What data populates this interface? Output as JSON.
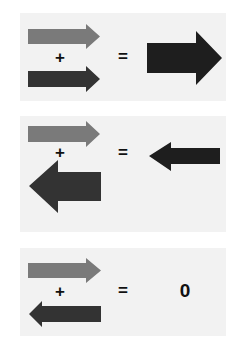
{
  "colors": {
    "background": "#ffffff",
    "panel": "#f2f2f2",
    "arrow_light": "#7a7a7a",
    "arrow_dark": "#333333",
    "arrow_result": "#1e1e1e"
  },
  "panels": [
    {
      "description": "Same-direction vectors add to a larger vector",
      "operand_a": {
        "direction": "right",
        "magnitude": "medium",
        "color": "light"
      },
      "plus_label": "+",
      "operand_b": {
        "direction": "right",
        "magnitude": "medium",
        "color": "dark"
      },
      "equals_label": "=",
      "result": {
        "direction": "right",
        "magnitude": "large"
      }
    },
    {
      "description": "Opposite vectors of unequal magnitude add to a smaller vector",
      "operand_a": {
        "direction": "right",
        "magnitude": "medium",
        "color": "light"
      },
      "plus_label": "+",
      "operand_b": {
        "direction": "left",
        "magnitude": "large",
        "color": "dark"
      },
      "equals_label": "=",
      "result": {
        "direction": "left",
        "magnitude": "small"
      }
    },
    {
      "description": "Equal and opposite vectors cancel to zero",
      "operand_a": {
        "direction": "right",
        "magnitude": "medium",
        "color": "light"
      },
      "plus_label": "+",
      "operand_b": {
        "direction": "left",
        "magnitude": "medium",
        "color": "dark"
      },
      "equals_label": "=",
      "result_label": "0"
    }
  ]
}
